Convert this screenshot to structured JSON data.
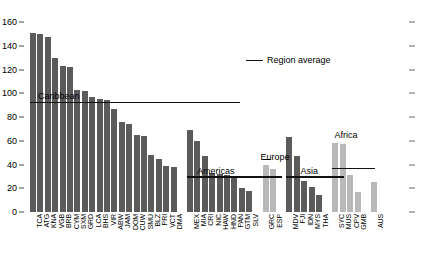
{
  "chart_data": {
    "type": "bar",
    "title": "",
    "xlabel": "",
    "ylabel": "",
    "ylim": [
      0,
      160
    ],
    "yticks": [
      0,
      20,
      40,
      60,
      80,
      100,
      120,
      140,
      160
    ],
    "grid": false,
    "legend": {
      "position": "top-center-right",
      "entries": [
        {
          "label": "Region average",
          "marker": "line",
          "color": "#111111"
        }
      ]
    },
    "bar_colors": {
      "dark": "#5b5b5b",
      "light": "#b9b9b9"
    },
    "groups": [
      {
        "name": "Caribbean",
        "label": "Caribbean",
        "average": 93,
        "shade": "dark",
        "categories": [
          "TCA",
          "ATG",
          "KNA",
          "VGB",
          "BRB",
          "CYM",
          "SXM",
          "GRD",
          "LCA",
          "BHS",
          "VIR",
          "ABW",
          "JAM",
          "DOM",
          "CUW",
          "SMU",
          "BLZ",
          "PRI",
          "VCT",
          "DMA"
        ],
        "values": [
          151,
          150,
          147,
          130,
          123,
          122,
          103,
          102,
          97,
          95,
          94,
          87,
          76,
          74,
          65,
          64,
          48,
          45,
          39,
          38
        ]
      },
      {
        "name": "Americas",
        "label": "Americas",
        "average": 30,
        "shade": "dark",
        "categories": [
          "MEX",
          "MIA",
          "CRI",
          "NIC",
          "HAW",
          "HND",
          "PAN",
          "GTM",
          "SLV"
        ],
        "values": [
          69,
          60,
          47,
          33,
          32,
          31,
          30,
          20,
          18
        ]
      },
      {
        "name": "Europe",
        "label": "Europe",
        "average": null,
        "shade": "light",
        "categories": [
          "GRC",
          "ESP"
        ],
        "values": [
          40,
          36
        ]
      },
      {
        "name": "Asia",
        "label": "Asia",
        "average": 30,
        "shade": "dark",
        "categories": [
          "MDV",
          "FJI",
          "IDN",
          "MYS",
          "THA"
        ],
        "values": [
          63,
          47,
          26,
          21,
          14
        ]
      },
      {
        "name": "Africa",
        "label": "Africa",
        "average": 37,
        "shade": "light",
        "categories": [
          "SYC",
          "MUS",
          "CPV",
          "GMB"
        ],
        "values": [
          58,
          57,
          31,
          17
        ]
      },
      {
        "name": "Oceania",
        "label": "",
        "average": null,
        "shade": "light",
        "categories": [
          "AUS"
        ],
        "values": [
          25
        ]
      }
    ]
  }
}
